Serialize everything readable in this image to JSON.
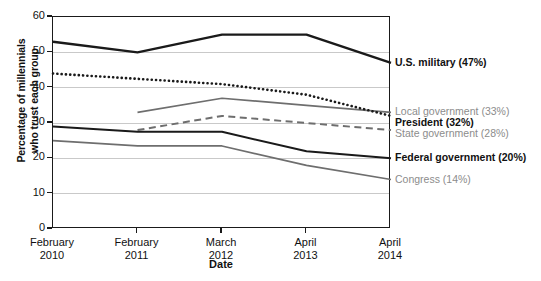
{
  "chart_data": {
    "type": "line",
    "title": "",
    "xlabel": "Date",
    "ylabel_line1": "Percentage of millennials",
    "ylabel_line2": "who trust each group",
    "categories": [
      "February 2010",
      "February 2011",
      "March 2012",
      "April 2013",
      "April 2014"
    ],
    "category_lines": [
      [
        "February",
        "2010"
      ],
      [
        "February",
        "2011"
      ],
      [
        "March",
        "2012"
      ],
      [
        "April",
        "2013"
      ],
      [
        "April",
        "2014"
      ]
    ],
    "ylim": [
      0,
      60
    ],
    "yticks": [
      0,
      10,
      20,
      30,
      40,
      50,
      60
    ],
    "grid": true,
    "legend_position": "right-inline",
    "series": [
      {
        "name": "U.S. military",
        "label": "U.S. military (47%)",
        "final_value": 47,
        "values": [
          53,
          50,
          55,
          55,
          47
        ],
        "color": "#1a1a1a",
        "style": "solid",
        "width": 2.4,
        "label_style": "bold"
      },
      {
        "name": "Local government",
        "label": "Local government (33%)",
        "final_value": 33,
        "values": [
          null,
          33,
          37,
          35,
          33
        ],
        "color": "#6e6e6e",
        "style": "solid",
        "width": 1.7,
        "label_style": "gray"
      },
      {
        "name": "President",
        "label": "President (32%)",
        "final_value": 32,
        "values": [
          44,
          42.5,
          41,
          38,
          32
        ],
        "color": "#1a1a1a",
        "style": "dotted",
        "width": 2.6,
        "label_style": "bold"
      },
      {
        "name": "State government",
        "label": "State government (28%)",
        "final_value": 28,
        "values": [
          null,
          28,
          32,
          30,
          28
        ],
        "color": "#6e6e6e",
        "style": "dashed",
        "width": 2.0,
        "label_style": "gray"
      },
      {
        "name": "Federal government",
        "label": "Federal government (20%)",
        "final_value": 20,
        "values": [
          29,
          27.5,
          27.5,
          22,
          20
        ],
        "color": "#1a1a1a",
        "style": "solid",
        "width": 2.0,
        "label_style": "bold"
      },
      {
        "name": "Congress",
        "label": "Congress (14%)",
        "final_value": 14,
        "values": [
          25,
          23.5,
          23.5,
          18,
          14
        ],
        "color": "#6e6e6e",
        "style": "solid",
        "width": 1.7,
        "label_style": "gray"
      }
    ]
  }
}
